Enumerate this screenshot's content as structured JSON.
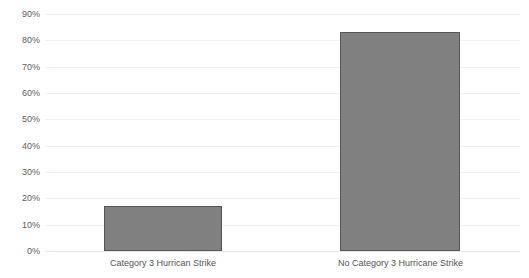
{
  "chart_data": {
    "type": "bar",
    "title": "",
    "title_clipped": true,
    "xlabel": "",
    "ylabel": "",
    "categories": [
      "Category 3 Hurrican Strike",
      "No Category 3 Hurricane Strike"
    ],
    "values": [
      17,
      83
    ],
    "value_labels": [
      "17%",
      "83%"
    ],
    "ylim": [
      0,
      90
    ],
    "ytick_labels": [
      "90%",
      "80%",
      "70%",
      "60%",
      "50%",
      "40%",
      "30%",
      "20%",
      "10%",
      "0%"
    ],
    "ytick_values": [
      90,
      80,
      70,
      60,
      50,
      40,
      30,
      20,
      10,
      0
    ],
    "grid": true,
    "grid_axis": "y",
    "legend": false,
    "legend_position": "none",
    "series": [
      {
        "name": "",
        "values": [
          17,
          83
        ]
      }
    ],
    "colors": {
      "bar_fill": "#808080",
      "bar_border": "#555555",
      "gridline": "#f2f2f2",
      "axis_text": "#606060",
      "category_text": "#555555",
      "background": "#ffffff"
    }
  }
}
